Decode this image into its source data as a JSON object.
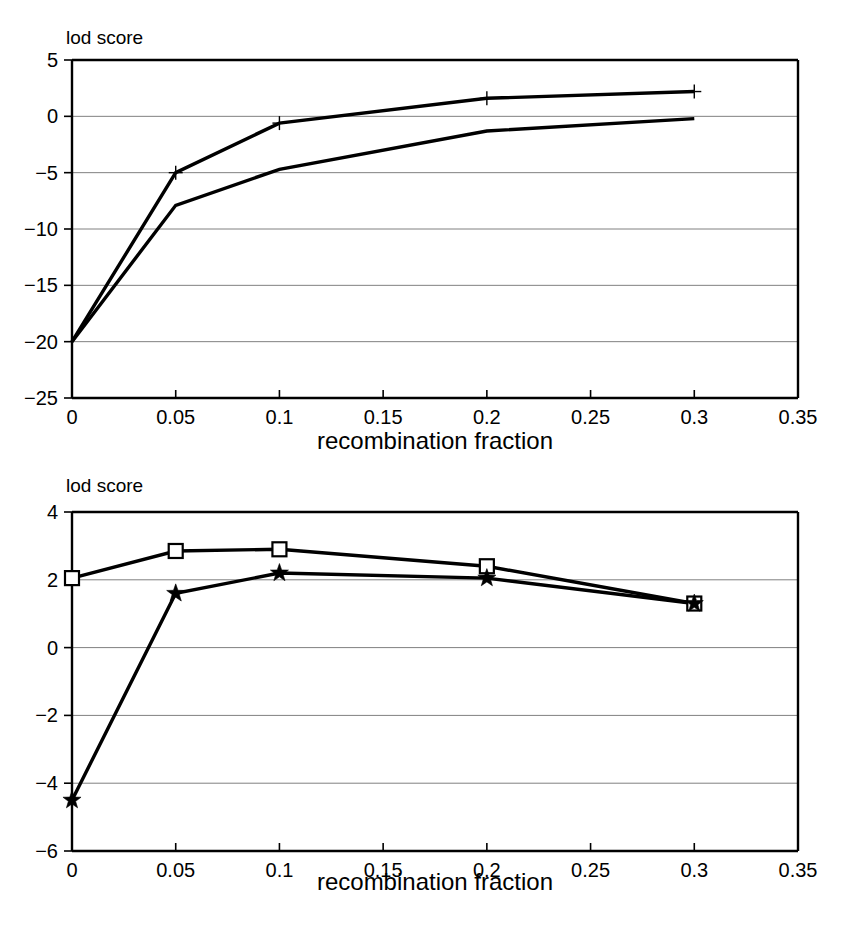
{
  "figure": {
    "background": "#ffffff",
    "line_color": "#000000",
    "grid_color": "#808080",
    "panel_count": 2
  },
  "chart_data": [
    {
      "id": "top",
      "type": "line",
      "title": "",
      "corner_label": "lod score",
      "xlabel": "recombination fraction",
      "ylabel": "lod score",
      "xlim": [
        0,
        0.35
      ],
      "ylim": [
        -25,
        5
      ],
      "grid": true,
      "legend": "none",
      "xticks": [
        0,
        0.05,
        0.1,
        0.15,
        0.2,
        0.25,
        0.3,
        0.35
      ],
      "xtick_labels": [
        "0",
        "0.05",
        "0.1",
        "0.15",
        "0.2",
        "0.25",
        "0.3",
        "0.35"
      ],
      "yticks": [
        5,
        0,
        -5,
        -10,
        -15,
        -20,
        -25
      ],
      "ytick_labels": [
        "5",
        "0",
        "−5",
        "−10",
        "−15",
        "−20",
        "−25"
      ],
      "x": [
        0,
        0.05,
        0.1,
        0.2,
        0.3
      ],
      "series": [
        {
          "name": "series-upper",
          "marker": "plus",
          "values": [
            -20.0,
            -5.0,
            -0.6,
            1.6,
            2.2
          ]
        },
        {
          "name": "series-lower",
          "marker": "none",
          "values": [
            -20.0,
            -7.9,
            -4.7,
            -1.3,
            -0.2
          ]
        }
      ]
    },
    {
      "id": "bottom",
      "type": "line",
      "title": "",
      "corner_label": "lod score",
      "xlabel": "recombination fraction",
      "ylabel": "lod score",
      "xlim": [
        0,
        0.35
      ],
      "ylim": [
        -6,
        4
      ],
      "grid": true,
      "legend": "none",
      "xticks": [
        0,
        0.05,
        0.1,
        0.15,
        0.2,
        0.25,
        0.3,
        0.35
      ],
      "xtick_labels": [
        "0",
        "0.05",
        "0.1",
        "0.15",
        "0.2",
        "0.25",
        "0.3",
        "0.35"
      ],
      "yticks": [
        4,
        2,
        0,
        -2,
        -4,
        -6
      ],
      "ytick_labels": [
        "4",
        "2",
        "0",
        "−2",
        "−4",
        "−6"
      ],
      "x": [
        0,
        0.05,
        0.1,
        0.2,
        0.3
      ],
      "series": [
        {
          "name": "series-square",
          "marker": "square",
          "values": [
            2.05,
            2.85,
            2.9,
            2.4,
            1.3
          ]
        },
        {
          "name": "series-star",
          "marker": "star",
          "values": [
            -4.5,
            1.6,
            2.2,
            2.05,
            1.3
          ]
        }
      ]
    }
  ]
}
